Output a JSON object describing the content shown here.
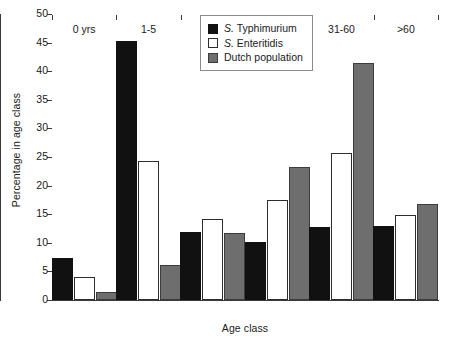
{
  "chart_data": {
    "type": "bar",
    "title": "",
    "xlabel": "Age class",
    "ylabel": "Percentage in age class",
    "categories": [
      "0 yrs",
      "1-5",
      "6-15",
      "16-30",
      "31-60",
      ">60"
    ],
    "ylim": [
      0,
      50
    ],
    "ytick_values": [
      0,
      5,
      10,
      15,
      20,
      25,
      30,
      35,
      40,
      45,
      50
    ],
    "ytick_labels": [
      "0",
      "5",
      "10",
      "15",
      "20",
      "25",
      "30",
      "35",
      "40",
      "45",
      "50"
    ],
    "grid": false,
    "legend_position": "top-center",
    "series": [
      {
        "name": "S. Typhimurium",
        "name_italic_prefix": "S.",
        "name_rest": " Typhimurium",
        "color": "#111111",
        "values": [
          7.4,
          45.3,
          11.9,
          10.1,
          12.8,
          13.0
        ]
      },
      {
        "name": "S. Enteritidis",
        "name_italic_prefix": "S.",
        "name_rest": " Enteritidis",
        "color": "#ffffff",
        "values": [
          4.0,
          24.3,
          14.2,
          17.5,
          25.7,
          14.9
        ]
      },
      {
        "name": "Dutch population",
        "name_italic_prefix": "",
        "name_rest": "Dutch population",
        "color": "#6e6e6e",
        "values": [
          1.4,
          6.2,
          11.8,
          23.3,
          41.4,
          16.8
        ]
      }
    ]
  }
}
